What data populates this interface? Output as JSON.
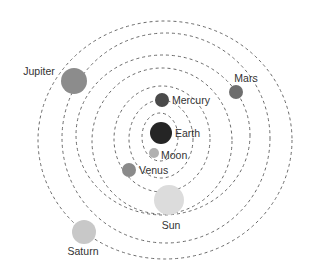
{
  "diagram": {
    "type": "geocentric-model",
    "orbit_style": {
      "stroke": "#6a6a6a",
      "dash": "3 3"
    },
    "orbits": [
      {
        "cx": 160,
        "cy": 137,
        "rx": 18,
        "ry": 24
      },
      {
        "cx": 161,
        "cy": 139,
        "rx": 32,
        "ry": 39
      },
      {
        "cx": 162,
        "cy": 139,
        "rx": 48,
        "ry": 53
      },
      {
        "cx": 162,
        "cy": 141,
        "rx": 70,
        "ry": 73
      },
      {
        "cx": 163,
        "cy": 135,
        "rx": 87,
        "ry": 80
      },
      {
        "cx": 166,
        "cy": 138,
        "rx": 104,
        "ry": 105
      },
      {
        "cx": 165,
        "cy": 140,
        "rx": 127,
        "ry": 119
      }
    ],
    "bodies": [
      {
        "name": "Earth",
        "cx": 161,
        "cy": 133,
        "r": 11,
        "color": "#252525",
        "label": "Earth",
        "lx": 175,
        "ly": 137,
        "anchor": "start"
      },
      {
        "name": "Moon",
        "cx": 154,
        "cy": 153,
        "r": 5,
        "color": "#b0b0b0",
        "label": "Moon",
        "lx": 161,
        "ly": 159,
        "anchor": "start"
      },
      {
        "name": "Mercury",
        "cx": 162,
        "cy": 100,
        "r": 7,
        "color": "#4a4a4a",
        "label": "Mercury",
        "lx": 172,
        "ly": 104,
        "anchor": "start"
      },
      {
        "name": "Venus",
        "cx": 129,
        "cy": 170,
        "r": 7,
        "color": "#8a8a8a",
        "label": "Venus",
        "lx": 139,
        "ly": 174,
        "anchor": "start"
      },
      {
        "name": "Sun",
        "cx": 169,
        "cy": 200,
        "r": 15,
        "color": "#dcdcdc",
        "label": "Sun",
        "lx": 171,
        "ly": 229,
        "anchor": "middle"
      },
      {
        "name": "Mars",
        "cx": 236,
        "cy": 92,
        "r": 7,
        "color": "#6e6e6e",
        "label": "Mars",
        "lx": 246,
        "ly": 82,
        "anchor": "middle"
      },
      {
        "name": "Jupiter",
        "cx": 74,
        "cy": 81,
        "r": 13,
        "color": "#8c8c8c",
        "label": "Jupiter",
        "lx": 39,
        "ly": 75,
        "anchor": "middle"
      },
      {
        "name": "Saturn",
        "cx": 84,
        "cy": 232,
        "r": 12,
        "color": "#c8c8c8",
        "label": "Saturn",
        "lx": 83,
        "ly": 255,
        "anchor": "middle"
      }
    ]
  }
}
